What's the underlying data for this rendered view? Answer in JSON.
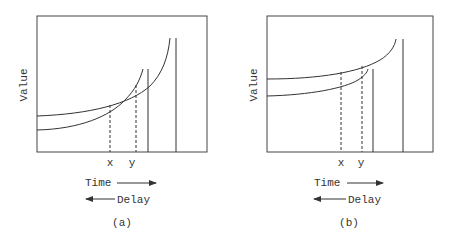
{
  "panels": [
    {
      "caption": "(a)",
      "ylabel": "Value",
      "markers": [
        "x",
        "y"
      ],
      "time_label": "Time",
      "delay_label": "Delay"
    },
    {
      "caption": "(b)",
      "ylabel": "Value",
      "markers": [
        "x",
        "y"
      ],
      "time_label": "Time",
      "delay_label": "Delay"
    }
  ],
  "colors": {
    "line": "#333333",
    "background": "#ffffff"
  }
}
